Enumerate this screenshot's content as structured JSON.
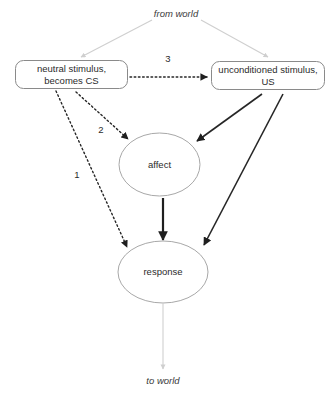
{
  "diagram": {
    "canvas": {
      "width": 334,
      "height": 398,
      "background": "#ffffff"
    },
    "colors": {
      "box_stroke": "#8a8a8a",
      "ellipse_stroke": "#a8a8a8",
      "edge_dark": "#262626",
      "edge_faint": "#cfcfcf",
      "text": "#2b2b2b",
      "background": "#ffffff"
    },
    "world_labels": {
      "from": "from world",
      "to": "to world"
    },
    "nodes": [
      {
        "id": "cs",
        "shape": "rounded-rect",
        "line1": "neutral stimulus,",
        "line2": "becomes CS"
      },
      {
        "id": "us",
        "shape": "rounded-rect",
        "line1": "unconditioned stimulus,",
        "line2": "US"
      },
      {
        "id": "affect",
        "shape": "ellipse",
        "label": "affect"
      },
      {
        "id": "response",
        "shape": "ellipse",
        "label": "response"
      }
    ],
    "edges": [
      {
        "id": "cs-to-response",
        "from": "cs",
        "to": "response",
        "style": "dotted",
        "label": "1"
      },
      {
        "id": "cs-to-affect",
        "from": "cs",
        "to": "affect",
        "style": "dotted",
        "label": "2"
      },
      {
        "id": "cs-to-us",
        "from": "cs",
        "to": "us",
        "style": "dotted",
        "label": "3"
      },
      {
        "id": "us-to-affect",
        "from": "us",
        "to": "affect",
        "style": "solid",
        "label": ""
      },
      {
        "id": "us-to-response",
        "from": "us",
        "to": "response",
        "style": "solid",
        "label": ""
      },
      {
        "id": "affect-to-response",
        "from": "affect",
        "to": "response",
        "style": "solid-thick",
        "label": ""
      },
      {
        "id": "world-to-cs",
        "from": "from world",
        "to": "cs",
        "style": "faint",
        "label": ""
      },
      {
        "id": "world-to-us",
        "from": "from world",
        "to": "us",
        "style": "faint",
        "label": ""
      },
      {
        "id": "response-to-world",
        "from": "response",
        "to": "to world",
        "style": "faint",
        "label": ""
      }
    ]
  }
}
